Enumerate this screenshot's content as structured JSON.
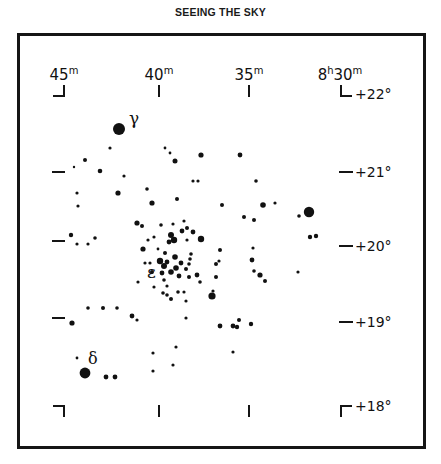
{
  "page": {
    "header": "SEEING THE SKY"
  },
  "chart_data": {
    "type": "scatter",
    "title": "",
    "xlabel": "Right Ascension",
    "ylabel": "Declination",
    "x_ticks": [
      {
        "label_main": "45",
        "label_sup": "m",
        "value": "8h45m",
        "px": 64
      },
      {
        "label_main": "40",
        "label_sup": "m",
        "value": "8h40m",
        "px": 159
      },
      {
        "label_main": "35",
        "label_sup": "m",
        "value": "8h35m",
        "px": 249
      },
      {
        "label_main": "8",
        "label_h": "h",
        "label_main2": "30",
        "label_sup": "m",
        "value": "8h30m",
        "px": 340
      }
    ],
    "y_ticks": [
      {
        "label": "+22°",
        "value": 22,
        "py": 94
      },
      {
        "label": "+21°",
        "value": 21,
        "py": 172
      },
      {
        "label": "+20°",
        "value": 20,
        "py": 246
      },
      {
        "label": "+19°",
        "value": 19,
        "py": 322
      },
      {
        "label": "+18°",
        "value": 18,
        "py": 406
      }
    ],
    "labels": [
      {
        "text": "γ",
        "x": 129,
        "y": 124,
        "size": 17
      },
      {
        "text": "ε",
        "x": 147,
        "y": 278,
        "size": 17
      },
      {
        "text": "δ",
        "x": 88,
        "y": 364,
        "size": 16
      }
    ],
    "grid": false,
    "stars": [
      {
        "x": 119,
        "y": 129,
        "r": 6
      },
      {
        "x": 110,
        "y": 148,
        "r": 1.6
      },
      {
        "x": 85,
        "y": 160,
        "r": 2
      },
      {
        "x": 74,
        "y": 167,
        "r": 1.2
      },
      {
        "x": 100,
        "y": 171,
        "r": 2.3
      },
      {
        "x": 124,
        "y": 176,
        "r": 1.6
      },
      {
        "x": 77,
        "y": 193,
        "r": 1.6
      },
      {
        "x": 118,
        "y": 193,
        "r": 2.6
      },
      {
        "x": 78,
        "y": 206,
        "r": 1.6
      },
      {
        "x": 165,
        "y": 148,
        "r": 1.4
      },
      {
        "x": 170,
        "y": 153,
        "r": 1.4
      },
      {
        "x": 175,
        "y": 161,
        "r": 2.5
      },
      {
        "x": 147,
        "y": 189,
        "r": 1.8
      },
      {
        "x": 152,
        "y": 203,
        "r": 2.6
      },
      {
        "x": 177,
        "y": 199,
        "r": 2
      },
      {
        "x": 201,
        "y": 155,
        "r": 2.6
      },
      {
        "x": 240,
        "y": 155,
        "r": 2.4
      },
      {
        "x": 193,
        "y": 181,
        "r": 1.6
      },
      {
        "x": 198,
        "y": 181,
        "r": 1.6
      },
      {
        "x": 256,
        "y": 181,
        "r": 1.8
      },
      {
        "x": 222,
        "y": 205,
        "r": 2
      },
      {
        "x": 263,
        "y": 205,
        "r": 2.8
      },
      {
        "x": 275,
        "y": 203,
        "r": 1.6
      },
      {
        "x": 244,
        "y": 217,
        "r": 2
      },
      {
        "x": 254,
        "y": 220,
        "r": 2
      },
      {
        "x": 299,
        "y": 216,
        "r": 1.8
      },
      {
        "x": 309,
        "y": 212,
        "r": 5.2
      },
      {
        "x": 310,
        "y": 237,
        "r": 2.2
      },
      {
        "x": 71,
        "y": 235,
        "r": 2.2
      },
      {
        "x": 77,
        "y": 244,
        "r": 1.6
      },
      {
        "x": 88,
        "y": 244,
        "r": 1.6
      },
      {
        "x": 95,
        "y": 238,
        "r": 1.8
      },
      {
        "x": 137,
        "y": 223,
        "r": 2.6
      },
      {
        "x": 142,
        "y": 226,
        "r": 2
      },
      {
        "x": 161,
        "y": 225,
        "r": 1.8
      },
      {
        "x": 173,
        "y": 224,
        "r": 1.6
      },
      {
        "x": 184,
        "y": 221,
        "r": 1.6
      },
      {
        "x": 187,
        "y": 228,
        "r": 2
      },
      {
        "x": 182,
        "y": 231,
        "r": 2.4
      },
      {
        "x": 171,
        "y": 235,
        "r": 3
      },
      {
        "x": 174,
        "y": 240,
        "r": 3.2
      },
      {
        "x": 169,
        "y": 242,
        "r": 2.4
      },
      {
        "x": 193,
        "y": 232,
        "r": 2.4
      },
      {
        "x": 154,
        "y": 237,
        "r": 1.6
      },
      {
        "x": 148,
        "y": 240,
        "r": 1.6
      },
      {
        "x": 143,
        "y": 249,
        "r": 2.6
      },
      {
        "x": 158,
        "y": 249,
        "r": 1.4
      },
      {
        "x": 165,
        "y": 253,
        "r": 2
      },
      {
        "x": 187,
        "y": 240,
        "r": 1.6
      },
      {
        "x": 201,
        "y": 239,
        "r": 3.2
      },
      {
        "x": 175,
        "y": 257,
        "r": 2.8
      },
      {
        "x": 160,
        "y": 261,
        "r": 3.2
      },
      {
        "x": 164,
        "y": 266,
        "r": 3
      },
      {
        "x": 167,
        "y": 262,
        "r": 2.4
      },
      {
        "x": 181,
        "y": 263,
        "r": 2.4
      },
      {
        "x": 150,
        "y": 263,
        "r": 1.6
      },
      {
        "x": 145,
        "y": 263,
        "r": 1.6
      },
      {
        "x": 191,
        "y": 254,
        "r": 1.8
      },
      {
        "x": 190,
        "y": 259,
        "r": 1.8
      },
      {
        "x": 189,
        "y": 264,
        "r": 1.8
      },
      {
        "x": 186,
        "y": 269,
        "r": 2
      },
      {
        "x": 176,
        "y": 268,
        "r": 2.8
      },
      {
        "x": 171,
        "y": 272,
        "r": 2.8
      },
      {
        "x": 162,
        "y": 273,
        "r": 2.4
      },
      {
        "x": 179,
        "y": 276,
        "r": 2.4
      },
      {
        "x": 164,
        "y": 280,
        "r": 1.8
      },
      {
        "x": 152,
        "y": 272,
        "r": 2
      },
      {
        "x": 189,
        "y": 277,
        "r": 2
      },
      {
        "x": 197,
        "y": 275,
        "r": 2.4
      },
      {
        "x": 200,
        "y": 282,
        "r": 1.8
      },
      {
        "x": 138,
        "y": 282,
        "r": 1.6
      },
      {
        "x": 154,
        "y": 287,
        "r": 1.6
      },
      {
        "x": 167,
        "y": 286,
        "r": 1.6
      },
      {
        "x": 163,
        "y": 293,
        "r": 1.8
      },
      {
        "x": 167,
        "y": 295,
        "r": 1.8
      },
      {
        "x": 171,
        "y": 299,
        "r": 2
      },
      {
        "x": 178,
        "y": 292,
        "r": 1.8
      },
      {
        "x": 184,
        "y": 292,
        "r": 1.6
      },
      {
        "x": 212,
        "y": 296,
        "r": 3.6
      },
      {
        "x": 219,
        "y": 261,
        "r": 1.6
      },
      {
        "x": 216,
        "y": 264,
        "r": 2
      },
      {
        "x": 216,
        "y": 277,
        "r": 2
      },
      {
        "x": 213,
        "y": 291,
        "r": 1.6
      },
      {
        "x": 220,
        "y": 250,
        "r": 2
      },
      {
        "x": 253,
        "y": 248,
        "r": 1.6
      },
      {
        "x": 252,
        "y": 260,
        "r": 2.4
      },
      {
        "x": 254,
        "y": 271,
        "r": 1.8
      },
      {
        "x": 260,
        "y": 275,
        "r": 2.6
      },
      {
        "x": 265,
        "y": 281,
        "r": 2
      },
      {
        "x": 298,
        "y": 272,
        "r": 1.6
      },
      {
        "x": 316,
        "y": 236,
        "r": 2.2
      },
      {
        "x": 72,
        "y": 323,
        "r": 2.6
      },
      {
        "x": 88,
        "y": 308,
        "r": 1.8
      },
      {
        "x": 103,
        "y": 308,
        "r": 2
      },
      {
        "x": 117,
        "y": 308,
        "r": 1.8
      },
      {
        "x": 132,
        "y": 316,
        "r": 2.4
      },
      {
        "x": 137,
        "y": 320,
        "r": 1.6
      },
      {
        "x": 186,
        "y": 318,
        "r": 1.6
      },
      {
        "x": 186,
        "y": 301,
        "r": 1.6
      },
      {
        "x": 220,
        "y": 326,
        "r": 2.4
      },
      {
        "x": 233,
        "y": 326,
        "r": 2.4
      },
      {
        "x": 237,
        "y": 327,
        "r": 2.2
      },
      {
        "x": 239,
        "y": 320,
        "r": 2
      },
      {
        "x": 251,
        "y": 324,
        "r": 2.2
      },
      {
        "x": 153,
        "y": 353,
        "r": 1.6
      },
      {
        "x": 176,
        "y": 347,
        "r": 1.6
      },
      {
        "x": 233,
        "y": 352,
        "r": 1.6
      },
      {
        "x": 153,
        "y": 371,
        "r": 1.6
      },
      {
        "x": 173,
        "y": 365,
        "r": 1.6
      },
      {
        "x": 77,
        "y": 358,
        "r": 1.4
      },
      {
        "x": 85,
        "y": 373,
        "r": 5.4
      },
      {
        "x": 106,
        "y": 377,
        "r": 2.4
      },
      {
        "x": 115,
        "y": 377,
        "r": 2.4
      }
    ],
    "axis_marks": {
      "top": [
        {
          "type": "corner-bl",
          "x": 64,
          "y": 86
        },
        {
          "type": "tick",
          "x": 159,
          "y": 86
        },
        {
          "type": "tick",
          "x": 249,
          "y": 86
        },
        {
          "type": "corner-br-right",
          "x": 341,
          "y": 86
        }
      ],
      "left": [
        {
          "type": "dash",
          "y": 172
        },
        {
          "type": "dash",
          "y": 241
        },
        {
          "type": "dash",
          "y": 318
        }
      ],
      "right": [
        {
          "type": "dash",
          "y": 172
        },
        {
          "type": "dash",
          "y": 246
        },
        {
          "type": "dash",
          "y": 322
        }
      ],
      "bottom": [
        {
          "type": "corner-tr",
          "x": 64,
          "y": 406
        },
        {
          "type": "tick",
          "x": 159,
          "y": 406
        },
        {
          "type": "tick",
          "x": 249,
          "y": 406
        },
        {
          "type": "corner-tl",
          "x": 341,
          "y": 406
        }
      ]
    }
  }
}
